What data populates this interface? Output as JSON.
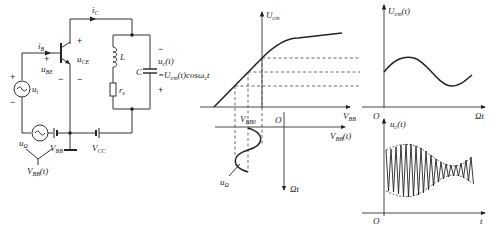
{
  "circuit": {
    "collector_current": {
      "main": "i",
      "sub": "C"
    },
    "base_current": {
      "main": "i",
      "sub": "B"
    },
    "ube": {
      "main": "u",
      "sub": "BE"
    },
    "uce": {
      "main": "u",
      "sub": "CE"
    },
    "input_source": {
      "main": "u",
      "sub": "i"
    },
    "inductor": "L",
    "capacitor": "C",
    "resistor": {
      "main": "r",
      "sub": "e"
    },
    "output_voltage": {
      "main": "u",
      "sub": "c",
      "suffix": "(t)"
    },
    "output_formula": {
      "prefix": "=U",
      "sub": "cm",
      "suffix": "(t)cosω",
      "sub2": "c",
      "tail": "t"
    },
    "modulating_source": {
      "main": "u",
      "sub": "Ω"
    },
    "bias_battery": {
      "main": "V",
      "sub": "BB"
    },
    "supply_battery": {
      "main": "V",
      "sub": "CC"
    },
    "combined_bias": {
      "main": "V",
      "sub": "BB",
      "suffix": "(t)"
    },
    "signs": {
      "plus": "+",
      "minus": "−"
    }
  },
  "transfer_graph": {
    "y_axis_label": {
      "main": "U",
      "sub": "cm"
    },
    "x_axis_label": {
      "main": "V",
      "sub": "BB"
    },
    "lower_x_label": {
      "main": "V",
      "sub": "BB",
      "suffix": "(t)"
    },
    "bias_point_label": {
      "main": "V",
      "sub": "BB0"
    },
    "origin_label": "O",
    "time_axis_label": "Ωt",
    "modulating_label": {
      "main": "u",
      "sub": "Ω"
    }
  },
  "envelope_graph": {
    "y_axis_label": {
      "main": "U",
      "sub": "cm",
      "suffix": "(t)"
    },
    "x_axis_label": "Ωt",
    "origin_label": "O"
  },
  "output_graph": {
    "y_axis_label": {
      "main": "u",
      "sub": "c",
      "suffix": "(t)"
    },
    "x_axis_label": "t",
    "origin_label": "O"
  },
  "colors": {
    "line": "#222222",
    "background": "#ffffff"
  }
}
